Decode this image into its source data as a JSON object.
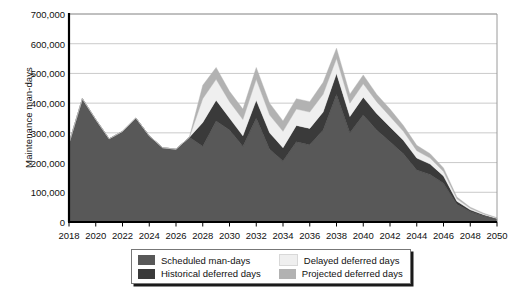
{
  "chart_data": {
    "type": "area",
    "stacked": true,
    "title": "",
    "xlabel": "",
    "ylabel": "Maintenance man-days",
    "ylim": [
      0,
      700000
    ],
    "xlim": [
      2018,
      2050
    ],
    "ytick_labels": [
      "0",
      "100,000",
      "200,000",
      "300,000",
      "400,000",
      "500,000",
      "600,000",
      "700,000"
    ],
    "ytick_values": [
      0,
      100000,
      200000,
      300000,
      400000,
      500000,
      600000,
      700000
    ],
    "xtick_labels": [
      "2018",
      "2020",
      "2022",
      "2024",
      "2026",
      "2028",
      "2030",
      "2032",
      "2034",
      "2036",
      "2038",
      "2040",
      "2042",
      "2044",
      "2046",
      "2048",
      "2050"
    ],
    "xtick_values": [
      2018,
      2020,
      2022,
      2024,
      2026,
      2028,
      2030,
      2032,
      2034,
      2036,
      2038,
      2040,
      2042,
      2044,
      2046,
      2048,
      2050
    ],
    "grid": "horizontal",
    "legend_position": "bottom",
    "x": [
      2018,
      2019,
      2020,
      2021,
      2022,
      2023,
      2024,
      2025,
      2026,
      2027,
      2028,
      2029,
      2030,
      2031,
      2032,
      2033,
      2034,
      2035,
      2036,
      2037,
      2038,
      2039,
      2040,
      2041,
      2042,
      2043,
      2044,
      2045,
      2046,
      2047,
      2048,
      2049,
      2050
    ],
    "series": [
      {
        "name": "Scheduled man-days",
        "color": "#585858",
        "values": [
          265000,
          415000,
          345000,
          280000,
          305000,
          350000,
          290000,
          250000,
          245000,
          285000,
          255000,
          340000,
          310000,
          255000,
          350000,
          245000,
          205000,
          270000,
          260000,
          310000,
          430000,
          300000,
          360000,
          310000,
          270000,
          230000,
          175000,
          160000,
          130000,
          60000,
          35000,
          20000,
          10000
        ]
      },
      {
        "name": "Historical deferred days",
        "color": "#3a3a3a",
        "values": [
          0,
          0,
          0,
          0,
          0,
          0,
          0,
          0,
          0,
          0,
          80000,
          70000,
          40000,
          35000,
          60000,
          55000,
          45000,
          55000,
          55000,
          60000,
          70000,
          55000,
          60000,
          55000,
          50000,
          45000,
          40000,
          35000,
          25000,
          10000,
          6000,
          4000,
          2000
        ]
      },
      {
        "name": "Delayed deferred days",
        "color": "#efefef",
        "values": [
          0,
          0,
          0,
          0,
          0,
          0,
          0,
          0,
          0,
          0,
          80000,
          70000,
          55000,
          55000,
          70000,
          60000,
          55000,
          55000,
          55000,
          60000,
          50000,
          45000,
          45000,
          40000,
          35000,
          30000,
          25000,
          20000,
          15000,
          8000,
          5000,
          3000,
          1500
        ]
      },
      {
        "name": "Projected deferred days",
        "color": "#b2b2b2",
        "values": [
          0,
          0,
          0,
          0,
          0,
          0,
          0,
          0,
          0,
          0,
          45000,
          40000,
          35000,
          35000,
          40000,
          40000,
          35000,
          35000,
          35000,
          40000,
          35000,
          30000,
          30000,
          25000,
          25000,
          20000,
          18000,
          15000,
          12000,
          6000,
          4000,
          2500,
          1000
        ]
      }
    ]
  },
  "legend": {
    "items": [
      {
        "label": "Scheduled man-days",
        "color": "#585858"
      },
      {
        "label": "Delayed deferred days",
        "color": "#efefef"
      },
      {
        "label": "Historical deferred days",
        "color": "#3a3a3a"
      },
      {
        "label": "Projected deferred days",
        "color": "#b2b2b2"
      }
    ]
  },
  "style": {
    "axis_color": "#000000",
    "grid_color": "#bdbdbd",
    "plot_border_color": "#9a9a9a",
    "text_color": "#111111"
  }
}
